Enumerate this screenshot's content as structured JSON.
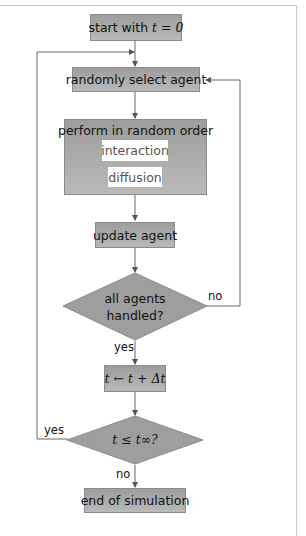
{
  "flowchart": {
    "start": "start with t = 0",
    "start_prefix": "start with ",
    "start_math": "t = 0",
    "select": "randomly select agent",
    "perform": "perform in random order",
    "perform_items": [
      "interaction",
      "diffusion"
    ],
    "update": "update agent",
    "decision1": {
      "line1": "all agents",
      "line2": "handled?"
    },
    "decision1_no": "no",
    "decision1_yes": "yes",
    "increment": "t ← t + Δt",
    "decision2": "t ≤ t∞?",
    "decision2_yes": "yes",
    "decision2_no": "no",
    "end": "end of simulation"
  },
  "colors": {
    "box_top": "#9d9d9d",
    "box_bottom": "#b9b9b9",
    "line": "#555555"
  }
}
